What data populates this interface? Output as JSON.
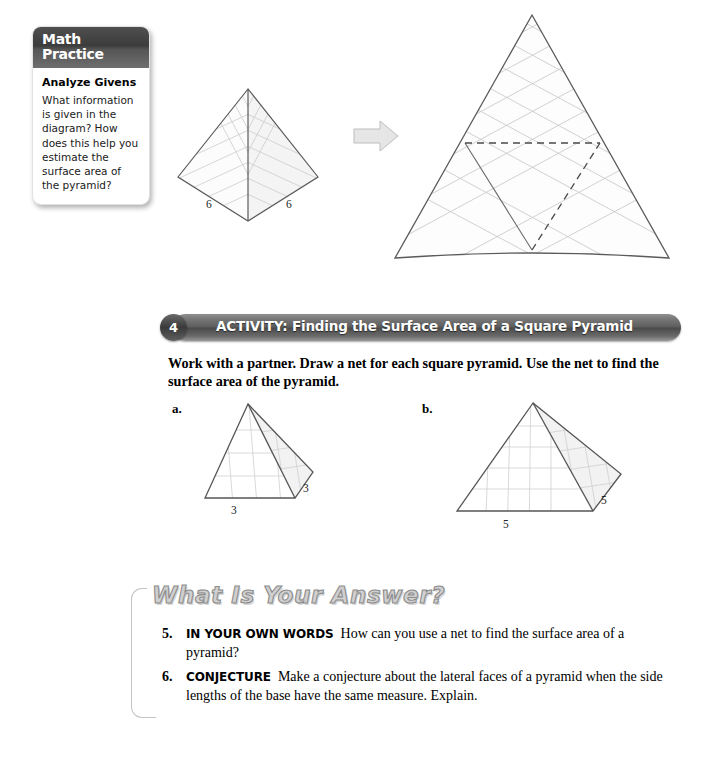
{
  "math_practice": {
    "header_lines": [
      "Math",
      "Practice"
    ],
    "subtitle": "Analyze Givens",
    "body": "What information is given in the diagram? How does this help you estimate the surface area of the pyramid?"
  },
  "top_figure": {
    "pyramid": {
      "label_left": "6",
      "label_right": "6"
    },
    "arrow": "right-arrow",
    "net": {
      "description": "large triangular net with grid and dashed fold lines"
    }
  },
  "activity": {
    "number": "4",
    "title": "ACTIVITY:  Finding the Surface Area of a Square Pyramid",
    "instructions": "Work with a partner. Draw a net for each square pyramid. Use the net to find the surface area of the pyramid."
  },
  "parts": [
    {
      "label": "a.",
      "base_label": "3",
      "side_label": "3"
    },
    {
      "label": "b.",
      "base_label": "5",
      "side_label": "5"
    }
  ],
  "answer_section": {
    "title": "What Is Your Answer?",
    "items": [
      {
        "number": "5.",
        "tag": "IN YOUR OWN WORDS",
        "text": "How can you use a net to find the surface area of a pyramid?"
      },
      {
        "number": "6.",
        "tag": "CONJECTURE",
        "text": "Make a conjecture about the lateral faces of a pyramid when the side lengths of the base have the same measure. Explain."
      }
    ]
  },
  "colors": {
    "bar_dark": "#4a4a4a",
    "grid_line": "#c9c9c9",
    "outline": "#555555",
    "arrow_fill": "#e4e4e4",
    "title_gray": "#d0d0d0"
  }
}
